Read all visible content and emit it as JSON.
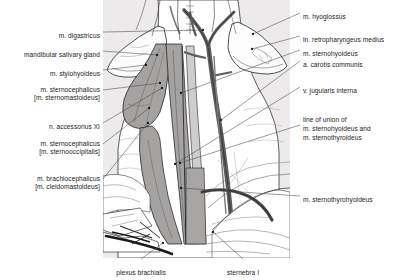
{
  "figure": {
    "background_color": "#ffffff",
    "panel_color": "#eceaea",
    "muscle_color": "#9d9a9a",
    "vessel_color": "#6d6a6a",
    "outline_color": "#1a1a1a",
    "leader_color": "#4a4a4a"
  },
  "labels_left": [
    {
      "id": "m-digastricus",
      "lines": [
        "m. digastricus"
      ],
      "x": 100,
      "y": 32,
      "target_x": 203,
      "target_y": 30
    },
    {
      "id": "mandibular-gland",
      "lines": [
        "mandibular salivary gland"
      ],
      "x": 100,
      "y": 51,
      "target_x": 157,
      "target_y": 55
    },
    {
      "id": "m-stylohyoideus",
      "lines": [
        "m. stylohyoideus"
      ],
      "x": 100,
      "y": 70,
      "target_x": 146,
      "target_y": 65
    },
    {
      "id": "m-sternocephalicus-mastoideus",
      "lines": [
        "m. sternocephalicus",
        "[m. sternomastoideus]"
      ],
      "x": 100,
      "y": 90,
      "target_x": 160,
      "target_y": 83
    },
    {
      "id": "n-accessorius-xi",
      "lines": [
        "n. accessorius XI"
      ],
      "x": 100,
      "y": 123,
      "target_x": 162,
      "target_y": 88
    },
    {
      "id": "m-sternocephalicus-occipitalis",
      "lines": [
        "m. sternocephalicus",
        "[m. sternooccipitalis]"
      ],
      "x": 100,
      "y": 144,
      "target_x": 149,
      "target_y": 108
    },
    {
      "id": "m-brachiocephalicus",
      "lines": [
        "m. brachiocephalicus",
        "[m. cleidomastoideus]"
      ],
      "x": 100,
      "y": 179,
      "target_x": 148,
      "target_y": 123
    }
  ],
  "labels_right": [
    {
      "id": "m-hyoglossus",
      "lines": [
        "m. hyoglossus"
      ],
      "x": 303,
      "y": 13,
      "target_x": 253,
      "target_y": 34
    },
    {
      "id": "ln-retropharyngeus",
      "lines": [
        "ln. retropharyngeus medius"
      ],
      "x": 303,
      "y": 36,
      "target_x": 252,
      "target_y": 49
    },
    {
      "id": "m-sternohyoideus",
      "lines": [
        "m. sternohyoideus"
      ],
      "x": 303,
      "y": 50,
      "target_x": 181,
      "target_y": 93
    },
    {
      "id": "a-carotis-communis",
      "lines": [
        "a. carotis communis"
      ],
      "x": 303,
      "y": 61,
      "target_x": 221,
      "target_y": 120
    },
    {
      "id": "v-jugularis-interna",
      "lines": [
        "v. jugularis interna"
      ],
      "x": 303,
      "y": 87,
      "target_x": 175,
      "target_y": 164
    },
    {
      "id": "line-of-union",
      "lines": [
        "line of union of",
        "m. sternohyoideus and",
        "m. sternothyroideus"
      ],
      "x": 303,
      "y": 125,
      "target_x": 180,
      "target_y": 163
    },
    {
      "id": "m-sternothyrohyoideus",
      "lines": [
        "m. sternothyrohyoideus"
      ],
      "x": 303,
      "y": 196,
      "target_x": 181,
      "target_y": 188
    }
  ],
  "labels_bottom": [
    {
      "id": "plexus-brachialis",
      "lines": [
        "plexus brachialis"
      ],
      "x": 141,
      "y": 269,
      "target_x": 163,
      "target_y": 243
    },
    {
      "id": "sternebra-i",
      "lines": [
        "sternebra I"
      ],
      "x": 243,
      "y": 269,
      "target_x": 213,
      "target_y": 232
    }
  ]
}
